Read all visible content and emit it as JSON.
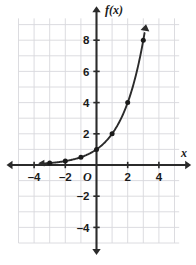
{
  "chart_data": {
    "type": "line",
    "title": "",
    "function_label": "f(x)",
    "xlabel": "x",
    "ylabel": "f(x)",
    "origin_label": "O",
    "xlim": [
      -5,
      5.3
    ],
    "ylim": [
      -5,
      9.4
    ],
    "grid": true,
    "grid_step": 1,
    "legend": "none",
    "x_tick_labels": [
      "–4",
      "–2",
      "2",
      "4"
    ],
    "x_tick_values": [
      -4,
      -2,
      2,
      4
    ],
    "y_tick_labels": [
      "8",
      "6",
      "4",
      "2",
      "–2",
      "–4"
    ],
    "y_tick_values": [
      8,
      6,
      4,
      2,
      -2,
      -4
    ],
    "series": [
      {
        "name": "f(x) = 2^x",
        "x": [
          -3,
          -2,
          -1,
          0,
          1,
          2,
          3
        ],
        "values": [
          0.125,
          0.25,
          0.5,
          1,
          2,
          4,
          8
        ],
        "marker": "filled-circle",
        "arrow_start": true,
        "arrow_end": true
      }
    ],
    "colors": {
      "axis": "#2b2b2b",
      "grid": "#d8d8dc",
      "curve": "#2b2b2b",
      "point": "#1a1a1a",
      "background": "#ffffff"
    }
  }
}
